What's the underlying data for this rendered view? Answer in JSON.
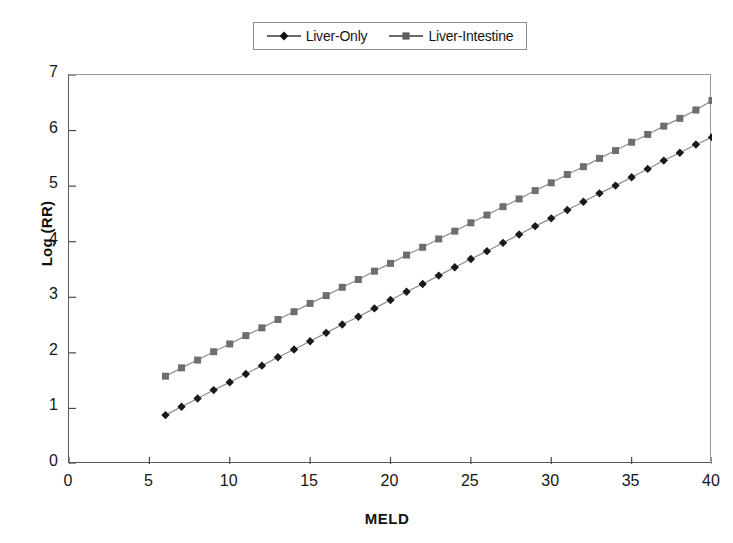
{
  "chart_data": {
    "type": "line",
    "title": "",
    "xlabel": "MELD",
    "ylabel": "Log (RR)",
    "xlim": [
      0,
      40
    ],
    "ylim": [
      0,
      7
    ],
    "xticks": [
      "0",
      "5",
      "10",
      "15",
      "20",
      "25",
      "30",
      "35",
      "40"
    ],
    "yticks": [
      "0",
      "1",
      "2",
      "3",
      "4",
      "5",
      "6",
      "7"
    ],
    "grid": false,
    "legend_position": "top-center",
    "x": [
      6,
      7,
      8,
      9,
      10,
      11,
      12,
      13,
      14,
      15,
      16,
      17,
      18,
      19,
      20,
      21,
      22,
      23,
      24,
      25,
      26,
      27,
      28,
      29,
      30,
      31,
      32,
      33,
      34,
      35,
      36,
      37,
      38,
      39,
      40
    ],
    "series": [
      {
        "name": "Liver-Only",
        "marker": "diamond",
        "color": "#1a1a1a",
        "values": [
          0.88,
          1.03,
          1.18,
          1.33,
          1.47,
          1.62,
          1.77,
          1.92,
          2.06,
          2.21,
          2.36,
          2.51,
          2.65,
          2.8,
          2.95,
          3.1,
          3.24,
          3.39,
          3.54,
          3.69,
          3.83,
          3.98,
          4.13,
          4.28,
          4.42,
          4.57,
          4.72,
          4.87,
          5.01,
          5.16,
          5.31,
          5.46,
          5.6,
          5.75,
          5.88
        ]
      },
      {
        "name": "Liver-Intestine",
        "marker": "square",
        "color": "#6e6e6e",
        "values": [
          1.58,
          1.73,
          1.87,
          2.02,
          2.16,
          2.31,
          2.45,
          2.6,
          2.74,
          2.89,
          3.03,
          3.18,
          3.32,
          3.47,
          3.61,
          3.76,
          3.9,
          4.05,
          4.19,
          4.34,
          4.48,
          4.63,
          4.77,
          4.92,
          5.06,
          5.21,
          5.35,
          5.5,
          5.64,
          5.79,
          5.93,
          6.08,
          6.22,
          6.37,
          6.54
        ]
      }
    ]
  },
  "legend": {
    "items": [
      {
        "label": "Liver-Only",
        "marker": "diamond-marker-icon"
      },
      {
        "label": "Liver-Intestine",
        "marker": "square-marker-icon"
      }
    ]
  },
  "axes": {
    "y_title": "Log (RR)",
    "x_title": "MELD"
  }
}
